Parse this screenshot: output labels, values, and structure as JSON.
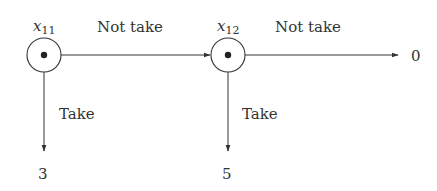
{
  "diagram": {
    "type": "decision-tree",
    "colors": {
      "stroke": "#333333",
      "background": "#ffffff"
    },
    "nodes": [
      {
        "id": "x11",
        "base": "x",
        "subscript": "11"
      },
      {
        "id": "x12",
        "base": "x",
        "subscript": "12"
      }
    ],
    "edges": [
      {
        "from": "x11",
        "to": "x12",
        "label": "Not take"
      },
      {
        "from": "x12",
        "to": "payoff-0",
        "label": "Not take"
      },
      {
        "from": "x11",
        "to": "payoff-3",
        "label": "Take"
      },
      {
        "from": "x12",
        "to": "payoff-5",
        "label": "Take"
      }
    ],
    "payoffs": {
      "right": "0",
      "take_x11": "3",
      "take_x12": "5"
    }
  }
}
